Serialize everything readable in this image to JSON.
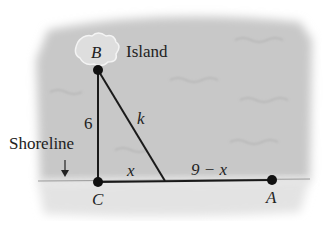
{
  "diagram": {
    "points": {
      "B": {
        "label": "B",
        "x": 98,
        "y": 70
      },
      "C": {
        "label": "C",
        "x": 98,
        "y": 182
      },
      "A": {
        "label": "A",
        "x": 272,
        "y": 180
      },
      "D": {
        "x": 165,
        "y": 181
      }
    },
    "labels": {
      "island": "Island",
      "shoreline": "Shoreline",
      "side_bc": "6",
      "side_bd": "k",
      "side_cd": "x",
      "side_da": "9 − x"
    },
    "colors": {
      "water": "#c9c9c9",
      "sand": "#e4e4e4",
      "line": "#1a1a1a",
      "island": "#dcdcdc"
    }
  }
}
